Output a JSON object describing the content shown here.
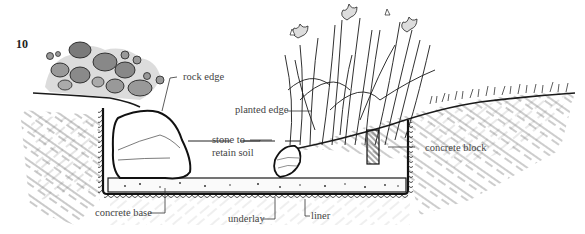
{
  "figure": {
    "number": "10"
  },
  "labels": {
    "rock_edge": "rock edge",
    "planted_edge": "planted edge",
    "stone_to_retain_soil_line1": "stone to",
    "stone_to_retain_soil_line2": "retain soil",
    "concrete_block": "concrete block",
    "concrete_base": "concrete base",
    "underlay": "underlay",
    "liner": "liner"
  },
  "colors": {
    "ink": "#1a1a1a",
    "label_text": "#444444",
    "leader_line": "#333333",
    "background": "#ffffff",
    "foliage_shade": "#8a8a8a"
  }
}
